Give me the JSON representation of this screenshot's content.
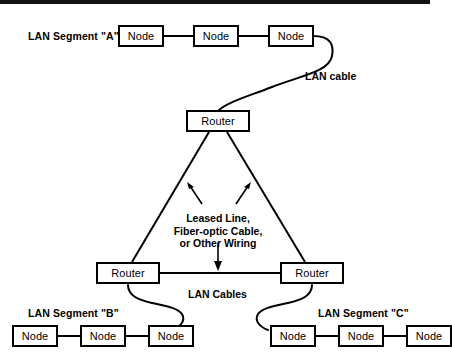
{
  "diagram": {
    "ink_color": "#000000",
    "background_color": "#ffffff",
    "segments": [
      {
        "id": "A",
        "label": "LAN Segment \"A\"",
        "nodes": [
          {
            "label": "Node"
          },
          {
            "label": "Node"
          },
          {
            "label": "Node"
          }
        ]
      },
      {
        "id": "B",
        "label": "LAN Segment \"B\"",
        "nodes": [
          {
            "label": "Node"
          },
          {
            "label": "Node"
          },
          {
            "label": "Node"
          }
        ]
      },
      {
        "id": "C",
        "label": "LAN Segment \"C\"",
        "nodes": [
          {
            "label": "Node"
          },
          {
            "label": "Node"
          },
          {
            "label": "Node"
          }
        ]
      }
    ],
    "routers": [
      {
        "id": "top",
        "label": "Router"
      },
      {
        "id": "bottom-left",
        "label": "Router"
      },
      {
        "id": "bottom-right",
        "label": "Router"
      }
    ],
    "annotations": {
      "lan_cable_top": "LAN cable",
      "lan_cables_bottom": "LAN Cables",
      "wan_link_line1": "Leased Line,",
      "wan_link_line2": "Fiber-optic Cable,",
      "wan_link_line3": "or Other Wiring"
    }
  }
}
